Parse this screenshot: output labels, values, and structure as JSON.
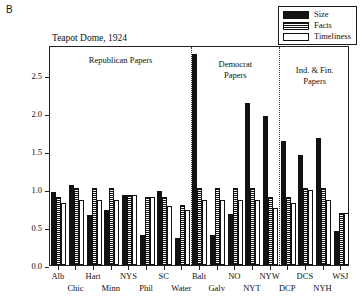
{
  "panel_label": "B",
  "legend": {
    "position": "top-right",
    "entries": [
      {
        "label": "Size",
        "fill": "solid-black",
        "color": "#111111"
      },
      {
        "label": "Facts",
        "fill": "horizontal-stripes",
        "color": "#111111"
      },
      {
        "label": "Timeliness",
        "fill": "white",
        "color": "#ffffff"
      }
    ]
  },
  "annotations": [
    {
      "name": "republican-papers",
      "lines": [
        "Republican Papers"
      ]
    },
    {
      "name": "democrat-papers",
      "lines": [
        "Democrat",
        "Papers"
      ]
    },
    {
      "name": "independent-financial-papers",
      "lines": [
        "Ind. & Fin.",
        "Papers"
      ]
    }
  ],
  "chart_data": {
    "type": "bar",
    "title": "Teapot Dome, 1924",
    "xlabel": "",
    "ylabel": "",
    "ylim": [
      0.0,
      2.9
    ],
    "yticks": [
      0.0,
      0.5,
      1.0,
      1.5,
      2.0,
      2.5
    ],
    "ytick_labels": [
      "0.0",
      "0.5",
      "1.0",
      "1.5",
      "2.0",
      "2.5"
    ],
    "grid": false,
    "legend_position": "top-right",
    "categories": [
      "Alb",
      "Chic",
      "Hart",
      "Minn",
      "NYS",
      "Phil",
      "SC",
      "Water",
      "Balt",
      "Galv",
      "NO",
      "NYT",
      "NYW",
      "DCP",
      "DCS",
      "NYH",
      "WSJ"
    ],
    "series": [
      {
        "name": "Size",
        "values": [
          0.96,
          1.05,
          0.66,
          0.73,
          0.92,
          0.39,
          0.98,
          0.36,
          2.78,
          0.39,
          0.67,
          2.14,
          1.96,
          1.63,
          1.45,
          1.68,
          0.45
        ]
      },
      {
        "name": "Facts",
        "values": [
          0.9,
          1.01,
          1.01,
          1.01,
          0.92,
          0.9,
          0.9,
          0.79,
          1.01,
          1.01,
          1.01,
          1.01,
          0.9,
          0.9,
          1.01,
          1.01,
          0.68
        ]
      },
      {
        "name": "Timeliness",
        "values": [
          0.82,
          0.86,
          0.86,
          0.86,
          0.92,
          0.9,
          0.78,
          0.73,
          0.86,
          0.86,
          0.86,
          0.86,
          0.75,
          0.82,
          0.99,
          0.86,
          0.69
        ]
      }
    ],
    "group_dividers_after": [
      "Water",
      "NYW"
    ],
    "groups": [
      {
        "label": "Republican Papers",
        "categories": [
          "Alb",
          "Chic",
          "Hart",
          "Minn",
          "NYS",
          "Phil",
          "SC",
          "Water"
        ]
      },
      {
        "label": "Democrat Papers",
        "categories": [
          "Balt",
          "Galv",
          "NO",
          "NYT",
          "NYW"
        ]
      },
      {
        "label": "Ind. & Fin. Papers",
        "categories": [
          "DCP",
          "DCS",
          "NYH",
          "WSJ"
        ]
      }
    ]
  }
}
